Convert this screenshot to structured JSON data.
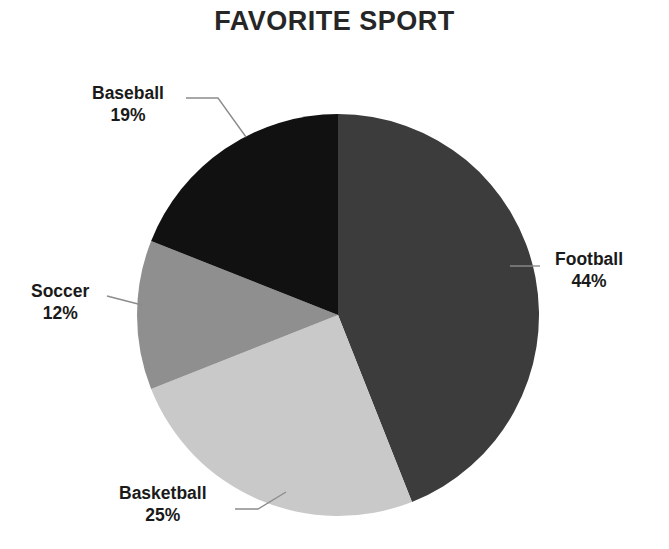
{
  "chart_data": {
    "type": "pie",
    "title": "FAVORITE SPORT",
    "xlabel": "",
    "ylabel": "",
    "legend": "none",
    "grid": false,
    "start_angle_deg": 0,
    "direction": "clockwise",
    "categories": [
      "Football",
      "Basketball",
      "Soccer",
      "Baseball"
    ],
    "values": [
      44,
      25,
      12,
      19
    ],
    "value_unit": "%",
    "labels": [
      {
        "name": "Football",
        "value": 44,
        "value_text": "44%",
        "color": "#3c3c3c",
        "position": "right"
      },
      {
        "name": "Basketball",
        "value": 25,
        "value_text": "25%",
        "color": "#c9c9c9",
        "position": "bottom-left"
      },
      {
        "name": "Soccer",
        "value": 12,
        "value_text": "12%",
        "color": "#8f8f8f",
        "position": "left"
      },
      {
        "name": "Baseball",
        "value": 19,
        "value_text": "19%",
        "color": "#111111",
        "position": "top-left"
      }
    ],
    "colors": [
      "#3c3c3c",
      "#c9c9c9",
      "#8f8f8f",
      "#111111"
    ],
    "leader_line_color": "#8c8c8c",
    "background": "#ffffff",
    "text_color": "#1a1a1a"
  },
  "labels": {
    "football": {
      "name": "Football",
      "value_text": "44%"
    },
    "basketball": {
      "name": "Basketball",
      "value_text": "25%"
    },
    "soccer": {
      "name": "Soccer",
      "value_text": "12%"
    },
    "baseball": {
      "name": "Baseball",
      "value_text": "19%"
    }
  }
}
